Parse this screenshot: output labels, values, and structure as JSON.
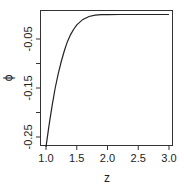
{
  "chart_data": {
    "type": "line",
    "title": "",
    "xlabel": "z",
    "ylabel": "ϕ",
    "xlim": [
      0.95,
      3.05
    ],
    "ylim": [
      -0.275,
      0.005
    ],
    "x_ticks": [
      1.0,
      1.5,
      2.0,
      2.5,
      3.0
    ],
    "x_tick_labels": [
      "1.0",
      "1.5",
      "2.0",
      "2.5",
      "3.0"
    ],
    "y_ticks": [
      -0.25,
      -0.2,
      -0.15,
      -0.1,
      -0.05
    ],
    "y_tick_labels": [
      "-0.25",
      "",
      "-0.15",
      "",
      "-0.05"
    ],
    "grid": false,
    "legend": null,
    "series": [
      {
        "name": "phi(z)",
        "color": "#222222",
        "x": [
          1.0,
          1.05,
          1.1,
          1.15,
          1.2,
          1.25,
          1.3,
          1.35,
          1.4,
          1.45,
          1.5,
          1.6,
          1.7,
          1.8,
          1.9,
          2.0,
          2.2,
          2.5,
          2.8,
          3.0
        ],
        "y": [
          -0.27,
          -0.225,
          -0.185,
          -0.15,
          -0.12,
          -0.095,
          -0.073,
          -0.055,
          -0.041,
          -0.03,
          -0.021,
          -0.01,
          -0.004,
          -0.0015,
          -0.0005,
          -0.0002,
          0.0,
          0.0,
          0.0,
          0.0
        ]
      }
    ]
  }
}
